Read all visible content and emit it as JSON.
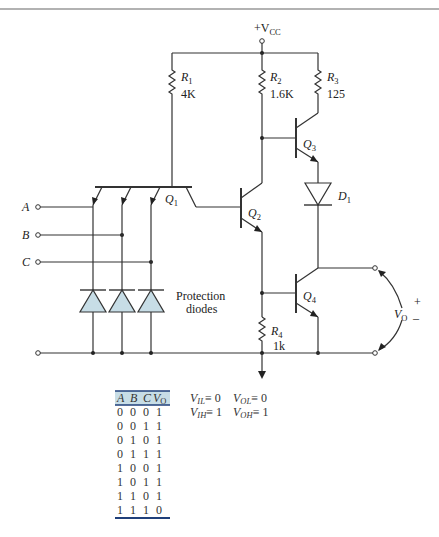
{
  "diagram": {
    "supply": {
      "label": "+V",
      "sub": "CC"
    },
    "resistors": [
      {
        "name": "R",
        "sub": "1",
        "value": "4K"
      },
      {
        "name": "R",
        "sub": "2",
        "value": "1.6K"
      },
      {
        "name": "R",
        "sub": "3",
        "value": "125"
      },
      {
        "name": "R",
        "sub": "4",
        "value": "1k"
      }
    ],
    "transistors": [
      {
        "name": "Q",
        "sub": "1"
      },
      {
        "name": "Q",
        "sub": "2"
      },
      {
        "name": "Q",
        "sub": "3"
      },
      {
        "name": "Q",
        "sub": "4"
      }
    ],
    "diode": {
      "name": "D",
      "sub": "1"
    },
    "inputs": [
      "A",
      "B",
      "C"
    ],
    "protection_label": [
      "Protection",
      "diodes"
    ],
    "output": {
      "name": "V",
      "sub": "O",
      "plus": "+",
      "minus": "–"
    }
  },
  "truth_table": {
    "headers": [
      "A",
      "B",
      "C",
      "V"
    ],
    "header_sub": "O",
    "rows": [
      [
        "0",
        "0",
        "0",
        "1"
      ],
      [
        "0",
        "0",
        "1",
        "1"
      ],
      [
        "0",
        "1",
        "0",
        "1"
      ],
      [
        "0",
        "1",
        "1",
        "1"
      ],
      [
        "1",
        "0",
        "0",
        "1"
      ],
      [
        "1",
        "0",
        "1",
        "1"
      ],
      [
        "1",
        "1",
        "0",
        "1"
      ],
      [
        "1",
        "1",
        "1",
        "0"
      ]
    ]
  },
  "logic_levels": [
    {
      "name": "V",
      "sub": "IL",
      "eq": "≡ 0"
    },
    {
      "name": "V",
      "sub": "OL",
      "eq": "≡ 0"
    },
    {
      "name": "V",
      "sub": "IH",
      "eq": "≡ 1"
    },
    {
      "name": "V",
      "sub": "OH",
      "eq": "≡ 1"
    }
  ],
  "colors": {
    "diode_fill": "#c7dde6",
    "table_rule": "#1f3f7a",
    "header_band": "#c7dde6"
  }
}
